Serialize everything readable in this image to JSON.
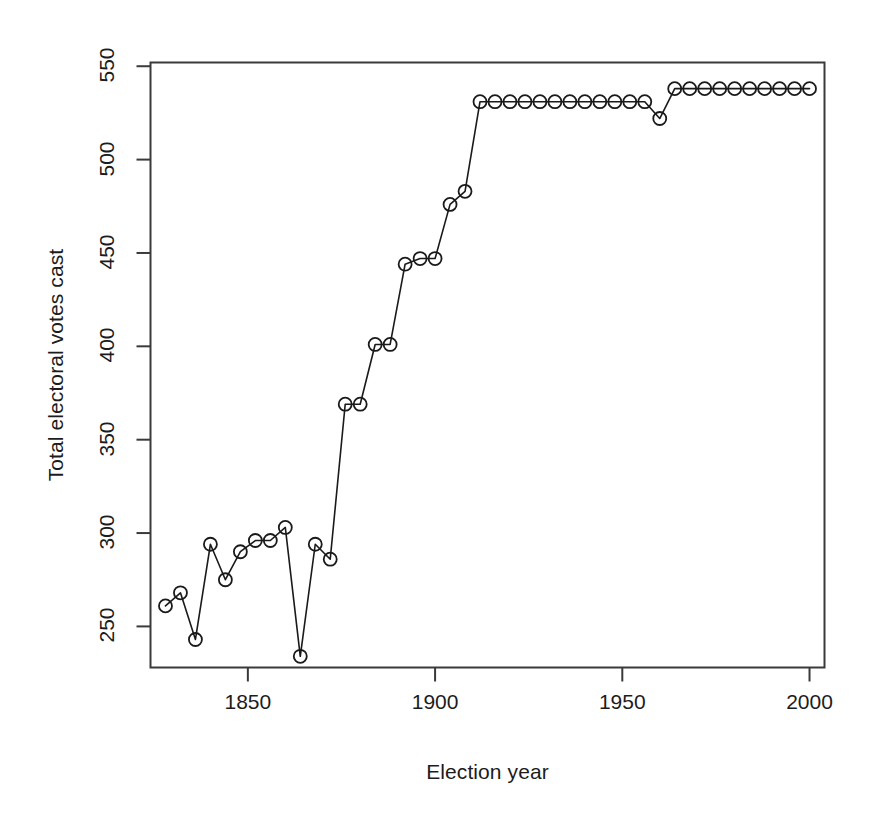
{
  "chart_data": {
    "type": "line",
    "title": "",
    "xlabel": "Election year",
    "ylabel": "Total electoral votes cast",
    "xlim": [
      1824,
      2004
    ],
    "ylim": [
      228,
      552
    ],
    "xticks": [
      1850,
      1900,
      1950,
      2000
    ],
    "yticks": [
      250,
      300,
      350,
      400,
      450,
      500,
      550
    ],
    "grid": false,
    "legend": null,
    "marker": "open-circle",
    "line_color": "#1a1a1a",
    "marker_color": "#1a1a1a",
    "background": "#ffffff",
    "x": [
      1828,
      1832,
      1836,
      1840,
      1844,
      1848,
      1852,
      1856,
      1860,
      1864,
      1868,
      1872,
      1876,
      1880,
      1884,
      1888,
      1892,
      1896,
      1900,
      1904,
      1908,
      1912,
      1916,
      1920,
      1924,
      1928,
      1932,
      1936,
      1940,
      1944,
      1948,
      1952,
      1956,
      1960,
      1964,
      1968,
      1972,
      1976,
      1980,
      1984,
      1988,
      1992,
      1996,
      2000
    ],
    "values": [
      261,
      268,
      243,
      294,
      275,
      290,
      296,
      296,
      303,
      234,
      294,
      286,
      369,
      369,
      401,
      401,
      444,
      447,
      447,
      476,
      483,
      531,
      531,
      531,
      531,
      531,
      531,
      531,
      531,
      531,
      531,
      531,
      531,
      522,
      538,
      538,
      538,
      538,
      538,
      538,
      538,
      538,
      538,
      538
    ],
    "series": [
      {
        "name": "Total electoral votes cast",
        "values": [
          261,
          268,
          243,
          294,
          275,
          290,
          296,
          296,
          303,
          234,
          294,
          286,
          369,
          369,
          401,
          401,
          444,
          447,
          447,
          476,
          483,
          531,
          531,
          531,
          531,
          531,
          531,
          531,
          531,
          531,
          531,
          531,
          531,
          522,
          538,
          538,
          538,
          538,
          538,
          538,
          538,
          538,
          538,
          538
        ]
      }
    ]
  },
  "axes": {
    "x_title": "Election year",
    "y_title": "Total electoral votes cast",
    "x_tick_labels": [
      "1850",
      "1900",
      "1950",
      "2000"
    ],
    "y_tick_labels": [
      "250",
      "300",
      "350",
      "400",
      "450",
      "500",
      "550"
    ]
  }
}
